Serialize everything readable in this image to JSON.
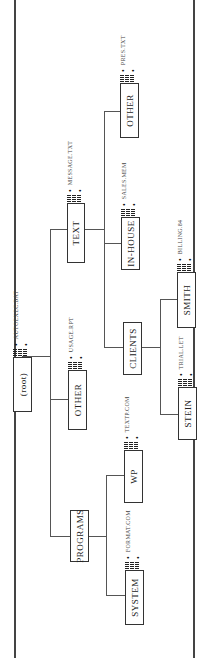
{
  "diagram": {
    "orientation": "rotated-90-ccw",
    "root": {
      "label": "(root)",
      "file": "AUTOEXEC.BAT",
      "children": [
        {
          "label": "TEXT",
          "file": "MESSAGE.TXT",
          "children": [
            {
              "label": "OTHER",
              "file": "PRES.TXT"
            },
            {
              "label": "IN-HOUSE",
              "file": "SALES.MEM"
            },
            {
              "label": "CLIENTS",
              "children": [
                {
                  "label": "SMITH",
                  "file": "BILLING.84"
                },
                {
                  "label": "STEIN",
                  "file": "TRIAL.LET"
                }
              ]
            }
          ]
        },
        {
          "label": "OTHER",
          "file": "USAGE.RPT"
        },
        {
          "label": "PROGRAMS",
          "children": [
            {
              "label": "WP",
              "file": "TEXTP.COM"
            },
            {
              "label": "SYSTEM",
              "file": "FORMAT.COM"
            }
          ]
        }
      ]
    },
    "ellipsis_glyph": "•"
  },
  "nodes": {
    "root": "(root)",
    "text": "TEXT",
    "other_root": "OTHER",
    "programs": "PROGRAMS",
    "other_text": "OTHER",
    "inhouse": "IN-HOUSE",
    "clients": "CLIENTS",
    "smith": "SMITH",
    "stein": "STEIN",
    "wp": "WP",
    "system": "SYSTEM"
  },
  "files": {
    "root": "AUTOEXEC.BAT",
    "text": "MESSAGE.TXT",
    "other_root": "USAGE.RPT",
    "other_text": "PRES.TXT",
    "inhouse": "SALES.MEM",
    "smith": "BILLING.84",
    "stein": "TRIAL.LET",
    "wp": "TEXTP.COM",
    "system": "FORMAT.COM"
  },
  "glyphs": {
    "dot": "•"
  }
}
